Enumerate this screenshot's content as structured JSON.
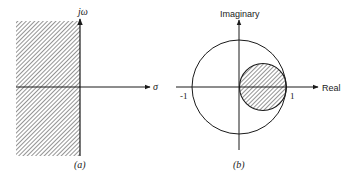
{
  "figure_a": {
    "caption": "(a)",
    "vertical_axis_label": "jω",
    "horizontal_axis_label": "σ",
    "shaded_region": "left half-plane"
  },
  "figure_b": {
    "caption": "(b)",
    "vertical_axis_label": "Imaginary",
    "horizontal_axis_label": "Real",
    "tick_neg_one": "-1",
    "tick_one": "1",
    "shaded_region": "circle centered at 0.5 with radius 0.5 inside unit circle"
  },
  "colors": {
    "line": "#1a1a1a",
    "hatch": "#3a3a3a",
    "background": "#ffffff"
  }
}
